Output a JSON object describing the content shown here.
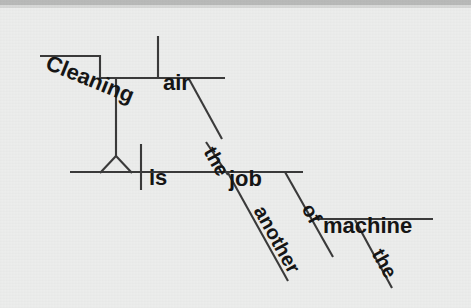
{
  "figure": {
    "kind": "reed-kellogg-sentence-diagram",
    "background_color": "#ecedec",
    "line_color": "#3a3a3a",
    "text_color": "#151515",
    "top_band_color": "#b9bab9",
    "sentence": "Cleaning the air is another job of the machine"
  },
  "words": {
    "gerund": "Cleaning",
    "object": "air",
    "object_article": "the",
    "verb": "is",
    "predicate_nominative": "job",
    "pn_modifier": "another",
    "preposition": "of",
    "prep_object": "machine",
    "prep_object_article": "the"
  }
}
